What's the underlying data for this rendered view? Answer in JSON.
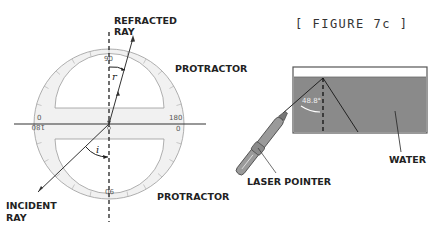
{
  "figure": {
    "title": "[ FIGURE 7c ]"
  },
  "left_diagram": {
    "labels": {
      "refracted_ray_line1": "REFRACTED",
      "refracted_ray_line2": "RAY",
      "protractor_top": "PROTRACTOR",
      "protractor_bottom": "PROTRACTOR",
      "incident_ray_line1": "INCIDENT",
      "incident_ray_line2": "RAY",
      "angle_r": "r",
      "angle_i": "i"
    },
    "protractor_marks": {
      "top_center": "90",
      "left_top": "0",
      "left_bottom": "180",
      "right_top": "180",
      "right_bottom": "0",
      "bottom_center": "90"
    }
  },
  "right_diagram": {
    "labels": {
      "water": "WATER",
      "laser_pointer": "LASER POINTER",
      "angle": "48.8°"
    },
    "colors": {
      "water": "#8a8a8a",
      "tank_border": "#555555"
    }
  }
}
